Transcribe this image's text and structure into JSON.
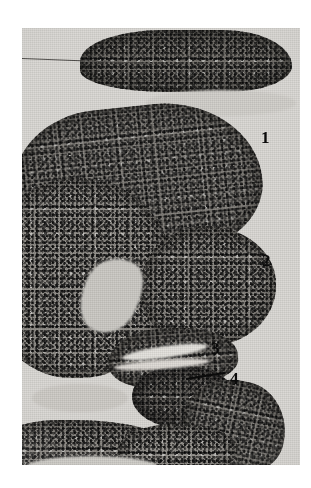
{
  "figure": {
    "type": "histological-micrograph",
    "medium": "black-and-white photographic print",
    "background_color": "#ffffff",
    "field_color": "#d8d6d2",
    "tissue_color": "#8d8a85",
    "annotation_color": "#0b0b0b"
  },
  "annotations": [
    {
      "id": "1",
      "label": "1",
      "target": "upper-large-lobe"
    },
    {
      "id": "2",
      "label": "2",
      "target": "middle-rounded-lobe"
    },
    {
      "id": "3",
      "label": "3",
      "target": "lower-small-lobe"
    },
    {
      "id": "4",
      "label": "4",
      "target": "basal-dark-structure",
      "leader_line": true
    }
  ],
  "structures": [
    {
      "name": "lobe-top",
      "description": "elongated dark lobe across the top of the field"
    },
    {
      "name": "lobe-one",
      "description": "large rounded lobe with blunt tip toward upper right"
    },
    {
      "name": "lobe-body",
      "description": "broad granular tissue mass on the left"
    },
    {
      "name": "lobe-two",
      "description": "rounded bud projecting to the right with dark rim"
    },
    {
      "name": "lobe-three",
      "description": "small lobe below the rounded bud"
    },
    {
      "name": "lobe-four",
      "description": "dark compact basal structure"
    },
    {
      "name": "lobe-lower-right",
      "description": "tissue band extending to lower right"
    },
    {
      "name": "lobe-bottom-left",
      "description": "tissue band along the lower left margin"
    },
    {
      "name": "lobe-bottom-center",
      "description": "pale tissue at the bottom center"
    }
  ],
  "clefts": [
    {
      "name": "cleft-a",
      "description": "pale cleft between left mass and rounded bud"
    },
    {
      "name": "cleft-b",
      "description": "narrow pale lumen above basal structure"
    },
    {
      "name": "cleft-c",
      "description": "second narrow pale lumen"
    },
    {
      "name": "cleft-d",
      "description": "pale region at lower left"
    },
    {
      "name": "cleft-e",
      "description": "pale gap beneath the top lobe"
    },
    {
      "name": "cleft-f",
      "description": "pale band near the bottom margin"
    }
  ]
}
